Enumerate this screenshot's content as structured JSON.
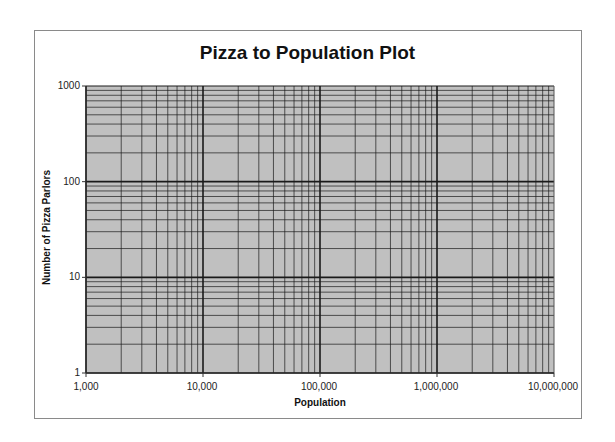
{
  "chart_data": {
    "type": "scatter",
    "title": "Pizza to Population Plot",
    "xlabel": "Population",
    "ylabel": "Number of Pizza Parlors",
    "x_scale": "log",
    "y_scale": "log",
    "xlim": [
      1000,
      10000000
    ],
    "ylim": [
      1,
      1000
    ],
    "x_ticks": [
      "1,000",
      "10,000",
      "100,000",
      "1,000,000",
      "10,000,000"
    ],
    "y_ticks": [
      "1",
      "10",
      "100",
      "1000"
    ],
    "grid": "major and minor log gridlines",
    "plot_background": "#c0c0c0",
    "series": []
  },
  "colors": {
    "plot_background": "#c0c0c0",
    "gridline": "#1a1a1a",
    "frame": "#8a8a8a"
  }
}
